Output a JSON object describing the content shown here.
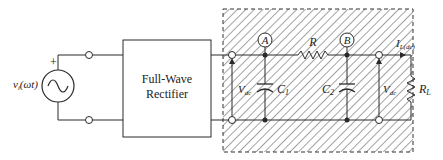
{
  "source": {
    "label": "v",
    "label_sub": "i",
    "label_arg": "(ωt)",
    "polarity": "+",
    "icon": "ac-source-icon"
  },
  "rectifier": {
    "line1": "Full-Wave",
    "line2": "Rectifier"
  },
  "filter": {
    "node_a": "A",
    "node_b": "B",
    "resistor": "R",
    "cap1": "C",
    "cap1_sub": "1",
    "cap2": "C",
    "cap2_sub": "2",
    "vin": "V",
    "vin_sub": "dc",
    "vout": "V",
    "vout_sub": "dc"
  },
  "load": {
    "current": "I",
    "current_sub": "L(dc)",
    "resistor": "R",
    "resistor_sub": "L"
  },
  "colors": {
    "line": "#2a2a2a",
    "hatch": "#555555",
    "background": "#ffffff"
  }
}
